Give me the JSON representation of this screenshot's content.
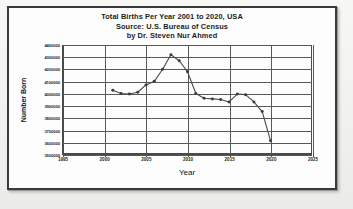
{
  "chart_data": {
    "type": "line",
    "title": "Total Births Per Year 2001 to 2020, USA",
    "subtitle": "Source: U.S. Bureau of Census",
    "byline": "by Dr. Steven Nur Ahmed",
    "xlabel": "Year",
    "ylabel": "Number Born",
    "xlim": [
      1995,
      2025
    ],
    "ylim": [
      3500000,
      4400000
    ],
    "grid": true,
    "legend": false,
    "legend_position": "none",
    "marker": "filled-circle",
    "line_color": "#4a4a4a",
    "xticks": [
      1995,
      2000,
      2005,
      2010,
      2015,
      2020,
      2025
    ],
    "xtick_labels": [
      "1995",
      "2000",
      "2005",
      "2010",
      "2015",
      "2020",
      "2025"
    ],
    "yticks": [
      3500000,
      3600000,
      3700000,
      3800000,
      3900000,
      4000000,
      4100000,
      4200000,
      4300000,
      4400000
    ],
    "ytick_labels": [
      "3500000",
      "3600000",
      "3700000",
      "3800000",
      "3900000",
      "4000000",
      "4100000",
      "4200000",
      "4300000",
      "4400000"
    ],
    "x": [
      2001,
      2002,
      2003,
      2004,
      2005,
      2006,
      2007,
      2008,
      2009,
      2010,
      2011,
      2012,
      2013,
      2014,
      2015,
      2016,
      2017,
      2018,
      2019,
      2020
    ],
    "values": [
      4026000,
      4000000,
      4000000,
      4030000,
      4090000,
      4145000,
      4270000,
      4320000,
      4250000,
      4180000,
      4000000,
      3960000,
      3940000,
      3940000,
      3930000,
      3990000,
      3985000,
      3940000,
      3880000,
      3820000
    ],
    "series": [
      {
        "name": "Number Born",
        "points": [
          {
            "year": 2001,
            "value": 4026000
          },
          {
            "year": 2002,
            "value": 4000000
          },
          {
            "year": 2003,
            "value": 3995000
          },
          {
            "year": 2004,
            "value": 4010000
          },
          {
            "year": 2005,
            "value": 4070000
          },
          {
            "year": 2006,
            "value": 4100000
          },
          {
            "year": 2007,
            "value": 4200000
          },
          {
            "year": 2008,
            "value": 4320000
          },
          {
            "year": 2009,
            "value": 4270000
          },
          {
            "year": 2010,
            "value": 4180000
          },
          {
            "year": 2011,
            "value": 4000000
          },
          {
            "year": 2012,
            "value": 3960000
          },
          {
            "year": 2013,
            "value": 3955000
          },
          {
            "year": 2014,
            "value": 3950000
          },
          {
            "year": 2015,
            "value": 3930000
          },
          {
            "year": 2016,
            "value": 3995000
          },
          {
            "year": 2017,
            "value": 3990000
          },
          {
            "year": 2018,
            "value": 3930000
          },
          {
            "year": 2019,
            "value": 3850000
          },
          {
            "year": 2020,
            "value": 3610000
          }
        ]
      }
    ]
  }
}
